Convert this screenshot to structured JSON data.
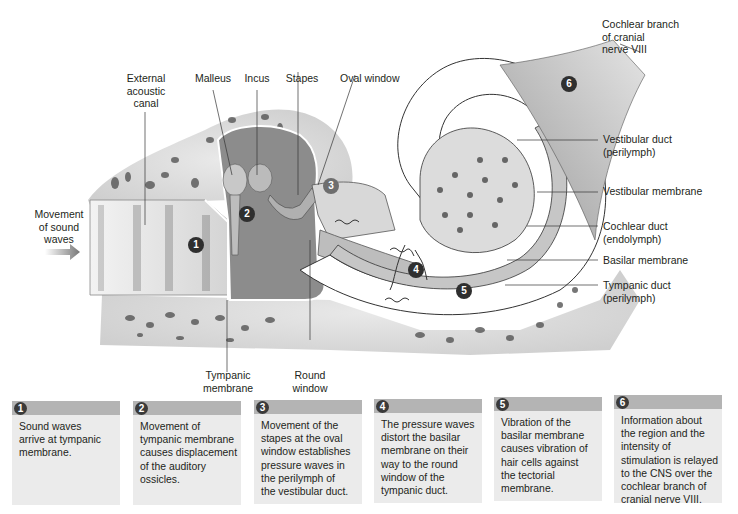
{
  "diagram": {
    "labels": {
      "external_acoustic_canal": "External\nacoustic\ncanal",
      "malleus": "Malleus",
      "incus": "Incus",
      "stapes": "Stapes",
      "oval_window": "Oval window",
      "cochlear_branch": "Cochlear branch\nof cranial\nnerve VIII",
      "vestibular_duct": "Vestibular duct\n(perilymph)",
      "vestibular_membrane": "Vestibular membrane",
      "cochlear_duct": "Cochlear duct\n(endolymph)",
      "basilar_membrane": "Basilar membrane",
      "tympanic_duct": "Tympanic duct\n(perilymph)",
      "movement_of_sound_waves": "Movement\nof sound\nwaves",
      "tympanic_membrane": "Tympanic\nmembrane",
      "round_window": "Round\nwindow"
    },
    "markers": [
      "1",
      "2",
      "3",
      "4",
      "5",
      "6"
    ]
  },
  "steps": [
    {
      "number": "1",
      "text": "Sound waves\narrive at tympanic\nmembrane."
    },
    {
      "number": "2",
      "text": "Movement of\ntympanic membrane\ncauses displacement\nof the auditory\nossicles."
    },
    {
      "number": "3",
      "text": "Movement of the\nstapes at the oval\nwindow establishes\npressure waves in\nthe perilymph of\nthe vestibular duct."
    },
    {
      "number": "4",
      "text": "The pressure waves\ndistort the basilar\nmembrane on their\nway to the round\nwindow of the\ntympanic duct."
    },
    {
      "number": "5",
      "text": "Vibration of the\nbasilar membrane\ncauses vibration of\nhair cells against\nthe tectorial\nmembrane."
    },
    {
      "number": "6",
      "text": "Information about\nthe region and the\nintensity of\nstimulation is relayed\nto the CNS over the\ncochlear branch of\ncranial nerve VIII."
    }
  ],
  "colors": {
    "box_bg": "#ebebeb",
    "box_header": "#b4b4b4",
    "marker": "#2f2f2f"
  }
}
